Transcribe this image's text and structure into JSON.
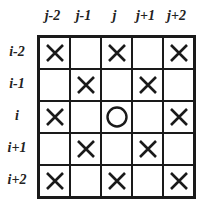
{
  "columns": [
    "j-2",
    "j-1",
    "j",
    "j+1",
    "j+2"
  ],
  "rows": [
    "i-2",
    "i-1",
    "i",
    "i+1",
    "i+2"
  ],
  "cells": [
    [
      "X",
      "",
      "X",
      "",
      "X"
    ],
    [
      "",
      "X",
      "",
      "X",
      ""
    ],
    [
      "X",
      "",
      "O",
      "",
      "X"
    ],
    [
      "",
      "X",
      "",
      "X",
      ""
    ],
    [
      "X",
      "",
      "X",
      "",
      "X"
    ]
  ],
  "legend": {
    "X": "x-mark-icon",
    "O": "circle-icon"
  },
  "colors": {
    "line": "#1a1a1a",
    "background": "#ffffff"
  }
}
